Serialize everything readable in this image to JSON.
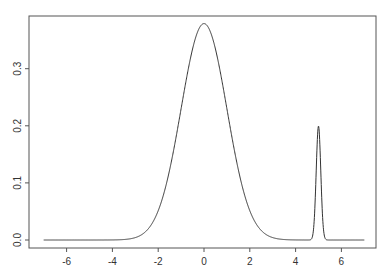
{
  "chart_data": {
    "type": "line",
    "title": "",
    "xlabel": "",
    "ylabel": "",
    "xlim": [
      -7.6,
      7.5
    ],
    "ylim": [
      -0.014,
      0.393
    ],
    "grid": false,
    "legend": null,
    "x_ticks": [
      -6,
      -4,
      -2,
      0,
      2,
      4,
      6
    ],
    "x_tick_labels": [
      "-6",
      "-4",
      "-2",
      "0",
      "2",
      "4",
      "6"
    ],
    "y_ticks": [
      0.0,
      0.1,
      0.2,
      0.3
    ],
    "y_tick_labels": [
      "0.0",
      "0.1",
      "0.2",
      "0.3"
    ],
    "series": [
      {
        "name": "density",
        "description": "Mixture density: 0.95*N(0,1) + 0.05*N(5,0.1^2)",
        "x_range": [
          -7,
          7
        ],
        "points": [
          [
            -7,
            0.0
          ],
          [
            -4,
            0.0001
          ],
          [
            -3,
            0.0042
          ],
          [
            -2.5,
            0.0166
          ],
          [
            -2,
            0.0513
          ],
          [
            -1.5,
            0.1234
          ],
          [
            -1,
            0.2299
          ],
          [
            -0.5,
            0.3344
          ],
          [
            0,
            0.379
          ],
          [
            0.5,
            0.3344
          ],
          [
            1,
            0.2299
          ],
          [
            1.5,
            0.1234
          ],
          [
            2,
            0.0513
          ],
          [
            2.5,
            0.0166
          ],
          [
            3,
            0.0042
          ],
          [
            4,
            0.0001
          ],
          [
            4.7,
            0.0022
          ],
          [
            4.8,
            0.027
          ],
          [
            4.9,
            0.121
          ],
          [
            5,
            0.1995
          ],
          [
            5.1,
            0.121
          ],
          [
            5.2,
            0.027
          ],
          [
            5.3,
            0.0022
          ],
          [
            6,
            0.0
          ],
          [
            7,
            0.0
          ]
        ],
        "color": "#333333"
      }
    ]
  },
  "axes": {
    "x_labels": [
      "-6",
      "-4",
      "-2",
      "0",
      "2",
      "4",
      "6"
    ],
    "y_labels": [
      "0.0",
      "0.1",
      "0.2",
      "0.3"
    ]
  }
}
